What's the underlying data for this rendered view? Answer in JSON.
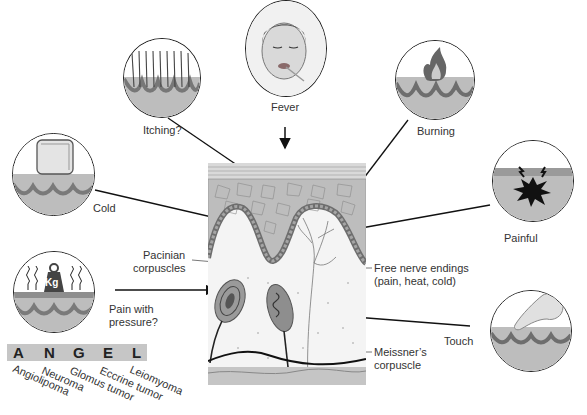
{
  "diagram": {
    "type": "skin sensation and painful tumor figure",
    "symptoms": [
      {
        "id": "fever",
        "label": "Fever",
        "icon": "face-with-thermometer"
      },
      {
        "id": "itching",
        "label": "Itching?",
        "icon": "hairs-on-skin"
      },
      {
        "id": "burning",
        "label": "Burning",
        "icon": "flame-on-skin"
      },
      {
        "id": "cold",
        "label": "Cold",
        "icon": "ice-cube-on-skin"
      },
      {
        "id": "painful",
        "label": "Painful",
        "icon": "burst-in-skin"
      },
      {
        "id": "pressure",
        "label_line1": "Pain with",
        "label_line2": "pressure?",
        "icon": "weight-on-skin",
        "weight_text": "Kg"
      },
      {
        "id": "touch",
        "label": "Touch",
        "icon": "finger-on-skin"
      }
    ],
    "structures": {
      "pacinian_line1": "Pacinian",
      "pacinian_line2": "corpuscles",
      "free_nerve_line1": "Free nerve endings",
      "free_nerve_line2": "(pain, heat, cold)",
      "meissner_line1": "Meissner’s",
      "meissner_line2": "corpuscle"
    },
    "mnemonic": {
      "letters": [
        "A",
        "N",
        "G",
        "E",
        "L"
      ],
      "words": [
        "Angiolipoma",
        "Neuroma",
        "Glomus tumor",
        "Eccrine tumor",
        "Leiomyoma"
      ]
    },
    "colors": {
      "skin_dermis": "#b9b9b9",
      "epidermis_cells": "#9c9c9c",
      "basal_layer": "#6e6e6e",
      "line": "#111111",
      "bar": "#c6c6c6"
    }
  }
}
